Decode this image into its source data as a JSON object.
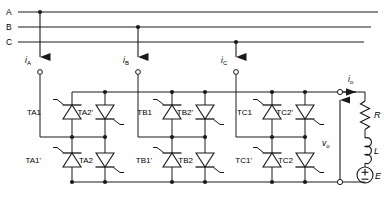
{
  "diagram": {
    "line_color": "#1a1a1a",
    "supply_lines": [
      {
        "label": "A"
      },
      {
        "label": "B"
      },
      {
        "label": "C"
      }
    ],
    "phase_currents": [
      {
        "symbol": "i",
        "sub": "A"
      },
      {
        "symbol": "i",
        "sub": "B"
      },
      {
        "symbol": "i",
        "sub": "C"
      }
    ],
    "output_current": {
      "symbol": "i",
      "sub": "o"
    },
    "output_voltage": {
      "symbol": "v",
      "sub": "o"
    },
    "thyristor_groups": [
      {
        "phase": "A",
        "upper_left": "TA1",
        "upper_right": "TA2'",
        "lower_left": "TA1'",
        "lower_right": "TA2"
      },
      {
        "phase": "B",
        "upper_left": "TB1",
        "upper_right": "TB2'",
        "lower_left": "TB1'",
        "lower_right": "TB2"
      },
      {
        "phase": "C",
        "upper_left": "TC1",
        "upper_right": "TC2'",
        "lower_left": "TC1'",
        "lower_right": "TC2"
      }
    ],
    "load": {
      "resistor": "R",
      "inductor": "L",
      "source": "E",
      "source_plus": "+",
      "source_minus": "−"
    }
  }
}
